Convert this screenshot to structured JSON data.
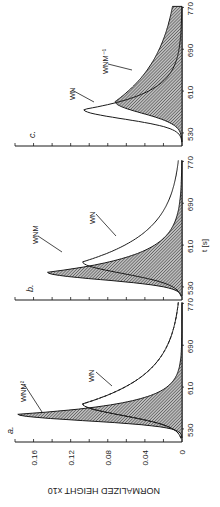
{
  "figure": {
    "rotation_deg": -90,
    "ylabel": "NORMALIZED HEIGHT x10",
    "xlabel": "t [s]",
    "colors": {
      "ink": "#1a1a1a",
      "hatch": "#555555",
      "paper": "#ffffff"
    }
  },
  "chart_data": [
    {
      "panel": "a.",
      "type": "line",
      "title": "a.",
      "xlabel": "t [s]",
      "ylabel": "NORMALIZED HEIGHT x10",
      "xlim": [
        505,
        775
      ],
      "ylim": [
        0,
        0.18
      ],
      "xticks": [
        530,
        610,
        690,
        770
      ],
      "yticks": [
        0,
        0.04,
        0.08,
        0.12,
        0.16
      ],
      "yticklabels": [
        "0",
        "0.04",
        "0.08",
        "0.12",
        "0.16"
      ],
      "series": [
        {
          "name": "W_N M^2",
          "label": "WNM²",
          "style": "filled-hatched",
          "peak_t": 558,
          "peak_h": 0.177,
          "rise": 12,
          "decay": 28
        },
        {
          "name": "W_N",
          "label": "WN",
          "style": "solid",
          "peak_t": 578,
          "peak_h": 0.107,
          "rise": 22,
          "decay": 75
        },
        {
          "name": "W_N (dashed inside)",
          "label": "",
          "style": "dashed",
          "peak_t": 578,
          "peak_h": 0.107,
          "rise": 22,
          "decay": 75
        }
      ]
    },
    {
      "panel": "b.",
      "type": "line",
      "title": "b.",
      "xlabel": "t [s]",
      "ylabel": "",
      "xlim": [
        505,
        775
      ],
      "ylim": [
        0,
        0.18
      ],
      "xticks": [
        530,
        610,
        690,
        770
      ],
      "series": [
        {
          "name": "W_N M",
          "label": "WNM",
          "style": "filled-hatched",
          "peak_t": 558,
          "peak_h": 0.145,
          "rise": 14,
          "decay": 42
        },
        {
          "name": "W_N",
          "label": "WN",
          "style": "solid",
          "peak_t": 578,
          "peak_h": 0.107,
          "rise": 22,
          "decay": 75
        }
      ]
    },
    {
      "panel": "c.",
      "type": "line",
      "title": "c.",
      "xlabel": "t [s]",
      "ylabel": "",
      "xlim": [
        505,
        775
      ],
      "ylim": [
        0,
        0.18
      ],
      "xticks": [
        530,
        610,
        690,
        770
      ],
      "series": [
        {
          "name": "W_N",
          "label": "WN",
          "style": "solid",
          "peak_t": 575,
          "peak_h": 0.106,
          "rise": 18,
          "decay": 42
        },
        {
          "name": "W_N M^-1",
          "label": "WNM⁻¹",
          "style": "filled-hatched",
          "peak_t": 590,
          "peak_h": 0.072,
          "rise": 22,
          "decay": 120
        }
      ]
    }
  ],
  "labels": {
    "panel_a": "a.",
    "panel_b": "b.",
    "panel_c": "c.",
    "a_curve_1": "WNM²",
    "a_curve_2": "WN",
    "b_curve_1": "WNM",
    "b_curve_2": "WN",
    "c_curve_1": "WN",
    "c_curve_2": "WNM⁻¹",
    "xticks": [
      "530",
      "610",
      "690",
      "770"
    ],
    "yticks": [
      "0",
      "0.04",
      "0.08",
      "0.12",
      "0.16"
    ],
    "xlabel": "t [s]",
    "ylabel": "NORMALIZED HEIGHT x10"
  }
}
